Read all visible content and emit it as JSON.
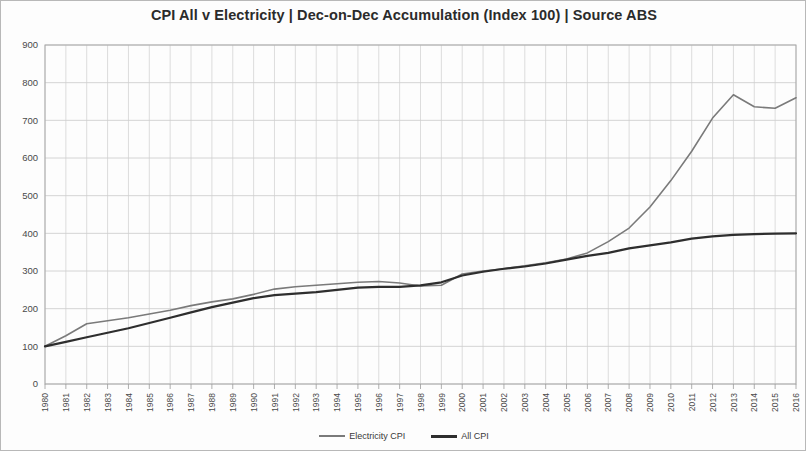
{
  "chart_data": {
    "type": "line",
    "title": "CPI All v Electricity | Dec-on-Dec Accumulation (Index 100) | Source ABS",
    "xlabel": "",
    "ylabel": "",
    "ylim": [
      0,
      900
    ],
    "ytick_step": 100,
    "yticks": [
      0,
      100,
      200,
      300,
      400,
      500,
      600,
      700,
      800,
      900
    ],
    "grid": true,
    "legend_position": "bottom",
    "x": [
      1980,
      1981,
      1982,
      1983,
      1984,
      1985,
      1986,
      1987,
      1988,
      1989,
      1990,
      1991,
      1992,
      1993,
      1994,
      1995,
      1996,
      1997,
      1998,
      1999,
      2000,
      2001,
      2002,
      2003,
      2004,
      2005,
      2006,
      2007,
      2008,
      2009,
      2010,
      2011,
      2012,
      2013,
      2014,
      2015,
      2016
    ],
    "xtick_labels": [
      "1980",
      "1981",
      "1982",
      "1983",
      "1984",
      "1985",
      "1986",
      "1987",
      "1988",
      "1989",
      "1990",
      "1991",
      "1992",
      "1993",
      "1994",
      "1995",
      "1996",
      "1997",
      "1998",
      "1999",
      "2000",
      "2001",
      "2002",
      "2003",
      "2004",
      "2005",
      "2006",
      "2007",
      "2008",
      "2009",
      "2010",
      "2011",
      "2012",
      "2013",
      "2014",
      "2015",
      "2016"
    ],
    "series": [
      {
        "name": "Electricity CPI",
        "color": "#7a7a7a",
        "width": 1.6,
        "values": [
          100,
          128,
          160,
          168,
          176,
          186,
          196,
          208,
          218,
          226,
          238,
          252,
          258,
          262,
          266,
          270,
          272,
          268,
          260,
          262,
          292,
          300,
          306,
          314,
          322,
          332,
          348,
          378,
          414,
          470,
          540,
          618,
          706,
          768,
          736,
          732,
          760
        ]
      },
      {
        "name": "All CPI",
        "color": "#2e2e2e",
        "width": 2.2,
        "values": [
          100,
          112,
          124,
          136,
          148,
          162,
          176,
          190,
          204,
          216,
          228,
          236,
          240,
          244,
          250,
          256,
          258,
          258,
          262,
          270,
          288,
          298,
          306,
          312,
          320,
          330,
          340,
          348,
          360,
          368,
          376,
          386,
          392,
          396,
          398,
          399,
          400
        ]
      }
    ]
  },
  "legend": {
    "items": [
      {
        "label": "Electricity CPI",
        "key": "elec"
      },
      {
        "label": "All CPI",
        "key": "all"
      }
    ]
  }
}
